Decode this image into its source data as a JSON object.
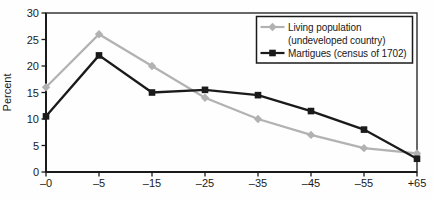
{
  "chart_data": {
    "type": "line",
    "title": "",
    "ylabel": "Percent",
    "xlabel": "",
    "ylim": [
      0,
      30
    ],
    "yticks": [
      0,
      5,
      10,
      15,
      20,
      25,
      30
    ],
    "categories": [
      "–0",
      "–5",
      "–15",
      "–25",
      "–35",
      "–45",
      "–55",
      "+65"
    ],
    "grid": false,
    "legend_position": "top-right",
    "axis_color": "#1a1a1a",
    "series": [
      {
        "name": "Living population (undeveloped country)",
        "name_lines": [
          "Living population",
          "(undeveloped country)"
        ],
        "marker": "diamond",
        "color": "#b2b2b2",
        "values": [
          16,
          26,
          20,
          14,
          10,
          7,
          4.5,
          3.5
        ]
      },
      {
        "name": "Martigues (census of 1702)",
        "name_lines": [
          "Martigues (census of 1702)"
        ],
        "marker": "square",
        "color": "#1a1a1a",
        "values": [
          10.5,
          22,
          15,
          15.5,
          14.5,
          11.5,
          8,
          2.5
        ]
      }
    ]
  }
}
